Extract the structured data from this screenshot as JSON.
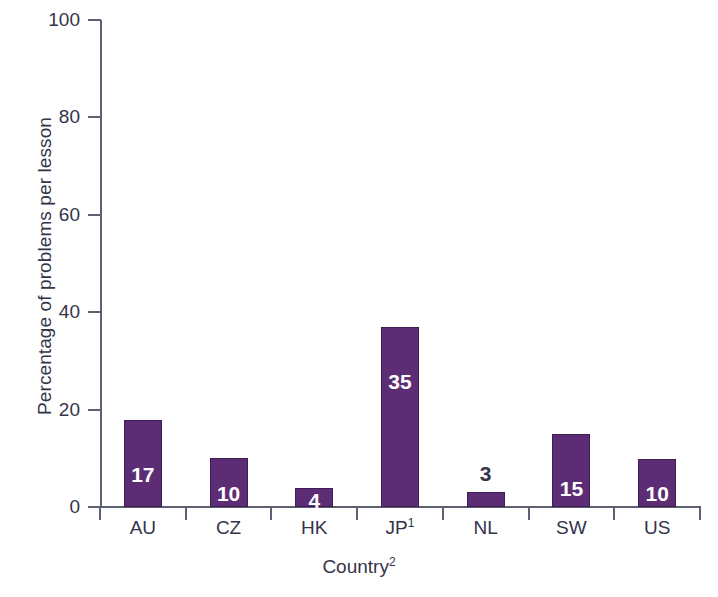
{
  "chart_data": {
    "type": "bar",
    "title": "",
    "subtitle": "",
    "xlabel": "Country",
    "xlabel_superscript": "2",
    "ylabel": "Percentage of problems per lesson",
    "categories": [
      "AU",
      "CZ",
      "HK",
      "JP",
      "NL",
      "SW",
      "US"
    ],
    "category_labels": [
      {
        "text": "AU",
        "superscript": ""
      },
      {
        "text": "CZ",
        "superscript": ""
      },
      {
        "text": "HK",
        "superscript": ""
      },
      {
        "text": "JP",
        "superscript": "1"
      },
      {
        "text": "NL",
        "superscript": ""
      },
      {
        "text": "SW",
        "superscript": ""
      },
      {
        "text": "US",
        "superscript": ""
      }
    ],
    "values": [
      17,
      10,
      4,
      35,
      3,
      15,
      10
    ],
    "bar_heights": [
      17.8,
      10.0,
      4.0,
      37.0,
      3.0,
      15.0,
      9.8
    ],
    "data_labels": [
      "17",
      "10",
      "4",
      "35",
      "3",
      "15",
      "10"
    ],
    "label_placement": [
      "inside",
      "inside",
      "inside",
      "inside",
      "outside",
      "inside",
      "inside"
    ],
    "ylim": [
      0,
      100
    ],
    "yticks": [
      0,
      20,
      40,
      60,
      80,
      100
    ],
    "ytick_labels": [
      "0",
      "20",
      "40",
      "60",
      "80",
      "100"
    ],
    "grid": false,
    "legend": false,
    "legend_position": "none",
    "bar_color": "#5C2D75",
    "bar_border_color": "#3F1D52",
    "inside_label_color": "#FFFFFF",
    "outside_label_color": "#343449",
    "axis_color": "#5C6070",
    "text_color": "#343449",
    "background_color": "#FFFFFF"
  }
}
